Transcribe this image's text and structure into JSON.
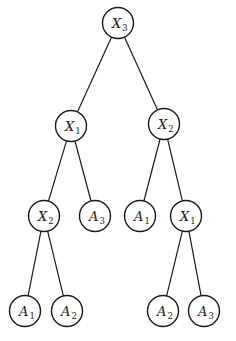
{
  "diagram": {
    "type": "decision-tree",
    "stroke_color": "#1a1a1a",
    "background": "#ffffff",
    "node_radius": 15.5,
    "nodes": [
      {
        "id": "n0",
        "var": "X",
        "sub": "3",
        "cx": 118,
        "cy": 23,
        "kind": "decision"
      },
      {
        "id": "n1",
        "var": "X",
        "sub": "1",
        "cx": 71,
        "cy": 126,
        "kind": "decision"
      },
      {
        "id": "n2",
        "var": "X",
        "sub": "2",
        "cx": 164,
        "cy": 124,
        "kind": "decision"
      },
      {
        "id": "n3",
        "var": "X",
        "sub": "2",
        "cx": 44,
        "cy": 216,
        "kind": "decision"
      },
      {
        "id": "n4",
        "var": "A",
        "sub": "3",
        "cx": 95,
        "cy": 216,
        "kind": "leaf"
      },
      {
        "id": "n5",
        "var": "A",
        "sub": "1",
        "cx": 140,
        "cy": 216,
        "kind": "leaf"
      },
      {
        "id": "n6",
        "var": "X",
        "sub": "1",
        "cx": 186,
        "cy": 216,
        "kind": "decision"
      },
      {
        "id": "n7",
        "var": "A",
        "sub": "1",
        "cx": 25,
        "cy": 311,
        "kind": "leaf"
      },
      {
        "id": "n8",
        "var": "A",
        "sub": "2",
        "cx": 67,
        "cy": 311,
        "kind": "leaf"
      },
      {
        "id": "n9",
        "var": "A",
        "sub": "2",
        "cx": 163,
        "cy": 311,
        "kind": "leaf"
      },
      {
        "id": "n10",
        "var": "A",
        "sub": "3",
        "cx": 204,
        "cy": 311,
        "kind": "leaf"
      }
    ],
    "edges": [
      {
        "from": "n0",
        "to": "n1"
      },
      {
        "from": "n0",
        "to": "n2"
      },
      {
        "from": "n1",
        "to": "n3"
      },
      {
        "from": "n1",
        "to": "n4"
      },
      {
        "from": "n2",
        "to": "n5"
      },
      {
        "from": "n2",
        "to": "n6"
      },
      {
        "from": "n3",
        "to": "n7"
      },
      {
        "from": "n3",
        "to": "n8"
      },
      {
        "from": "n6",
        "to": "n9"
      },
      {
        "from": "n6",
        "to": "n10"
      }
    ]
  }
}
